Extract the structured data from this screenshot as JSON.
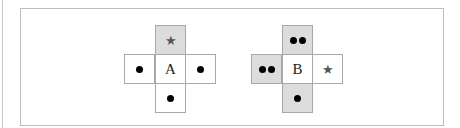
{
  "figure": {
    "left_net": {
      "center_label": "A",
      "cells": {
        "top": {
          "symbol": "star",
          "dots": 0,
          "shaded": true
        },
        "left": {
          "symbol": "dots",
          "dots": 1,
          "shaded": false
        },
        "right": {
          "symbol": "dots",
          "dots": 1,
          "shaded": false
        },
        "bottom": {
          "symbol": "dots",
          "dots": 1,
          "shaded": false
        }
      }
    },
    "right_net": {
      "center_label": "B",
      "cells": {
        "top": {
          "symbol": "dots",
          "dots": 2,
          "shaded": true
        },
        "left": {
          "symbol": "dots",
          "dots": 2,
          "shaded": true
        },
        "right": {
          "symbol": "star",
          "dots": 0,
          "shaded": false
        },
        "bottom": {
          "symbol": "dots",
          "dots": 1,
          "shaded": true
        }
      }
    },
    "star_glyph": "★",
    "colors": {
      "shade": "#dcdcdc",
      "border": "#a8a8a8",
      "dot": "#000000",
      "star": "#555555"
    }
  }
}
